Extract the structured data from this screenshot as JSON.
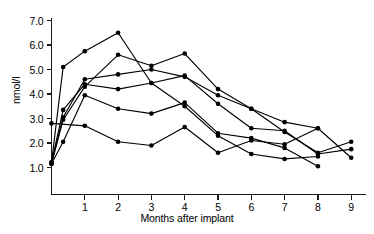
{
  "chart_data": {
    "type": "line",
    "title": "",
    "xlabel": "Months after implant",
    "ylabel": "nmol/l",
    "xlim": [
      0,
      9.5
    ],
    "ylim": [
      0.6,
      7.0
    ],
    "grid": false,
    "legend": false,
    "marker": "filled-circle",
    "xticks": [
      1,
      2,
      3,
      4,
      5,
      6,
      7,
      8,
      9
    ],
    "xtick_labels": [
      "1",
      "2",
      "3",
      "4",
      "5",
      "6",
      "7",
      "8",
      "9"
    ],
    "yticks": [
      1.0,
      2.0,
      3.0,
      4.0,
      5.0,
      6.0,
      7.0
    ],
    "ytick_labels": [
      "1.0",
      "2.0",
      "3.0",
      "4.0",
      "5.0",
      "6.0",
      "7.0"
    ],
    "series": [
      {
        "name": "subject-1",
        "x": [
          0.0,
          0.35,
          1.0,
          2.0,
          3.0,
          4.0,
          5.0,
          6.0,
          7.0,
          8.0
        ],
        "y": [
          1.2,
          5.1,
          5.75,
          6.5,
          4.45,
          3.5,
          2.3,
          1.55,
          1.35,
          1.45
        ]
      },
      {
        "name": "subject-2",
        "x": [
          0.0,
          0.35,
          1.0,
          2.0,
          3.0,
          4.0,
          5.0,
          6.0,
          7.0,
          8.0,
          9.0
        ],
        "y": [
          1.15,
          2.95,
          4.3,
          5.6,
          5.15,
          5.65,
          4.2,
          3.4,
          2.85,
          2.6,
          1.4
        ]
      },
      {
        "name": "subject-3",
        "x": [
          0.0,
          0.35,
          1.0,
          2.0,
          3.0,
          4.0,
          5.0,
          6.0,
          7.0,
          8.0,
          9.0
        ],
        "y": [
          1.2,
          3.05,
          4.6,
          4.8,
          5.0,
          4.7,
          3.95,
          3.4,
          2.45,
          1.6,
          2.05
        ]
      },
      {
        "name": "subject-4",
        "x": [
          0.0,
          0.35,
          1.0,
          2.0,
          3.0,
          4.0,
          5.0,
          6.0,
          7.0,
          8.0,
          9.0
        ],
        "y": [
          1.2,
          3.35,
          4.4,
          4.2,
          4.45,
          4.75,
          3.6,
          2.6,
          2.5,
          1.55,
          1.75
        ]
      },
      {
        "name": "subject-5",
        "x": [
          0.0,
          0.35,
          1.0,
          2.0,
          3.0,
          4.0,
          5.0,
          6.0,
          7.0,
          8.0
        ],
        "y": [
          1.15,
          2.05,
          3.95,
          3.4,
          3.2,
          3.65,
          2.4,
          2.2,
          1.8,
          1.05
        ]
      },
      {
        "name": "subject-6",
        "x": [
          0.0,
          1.0,
          2.0,
          3.0,
          4.0,
          5.0,
          6.0,
          7.0,
          8.0
        ],
        "y": [
          2.8,
          2.7,
          2.05,
          1.9,
          2.65,
          1.6,
          2.1,
          1.95,
          2.6
        ]
      }
    ]
  },
  "axes": {
    "ylabel": "nmol/l",
    "xlabel": "Months after implant"
  }
}
